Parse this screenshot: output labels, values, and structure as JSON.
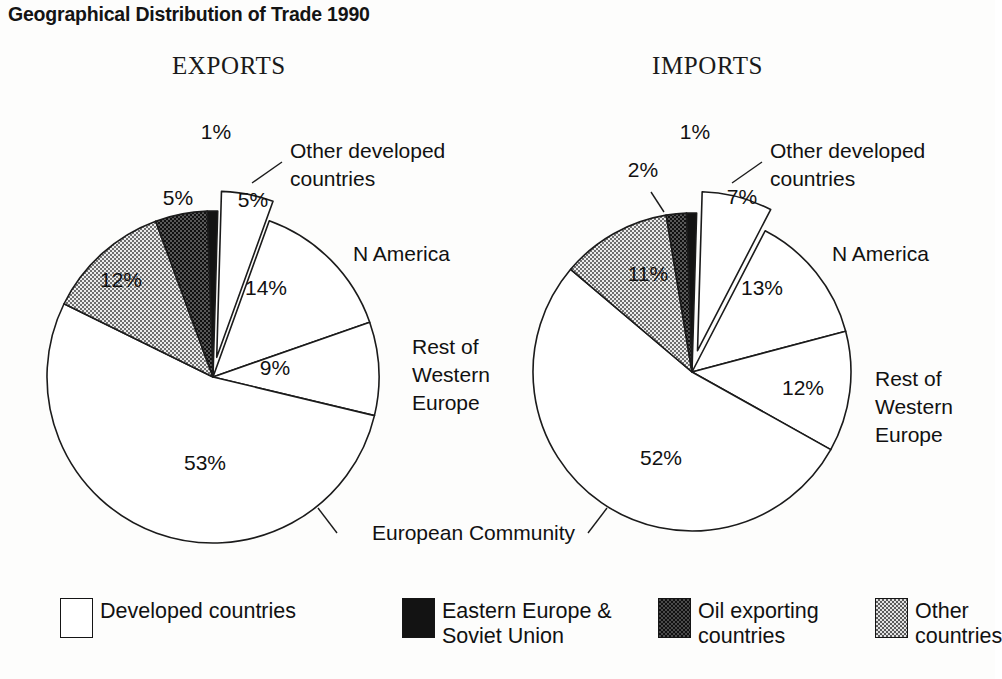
{
  "title": "Geographical Distribution of Trade 1990",
  "panels": {
    "exports_heading": "EXPORTS",
    "imports_heading": "IMPORTS"
  },
  "shared_labels": {
    "european_community": "European Community",
    "other_developed": "Other developed\ncountries",
    "other_developed_line1": "Other developed",
    "other_developed_line2": "countries",
    "n_america": "N America",
    "rest_w_europe_line1": "Rest of",
    "rest_w_europe_line2": "Western",
    "rest_w_europe_line3": "Europe"
  },
  "legend": {
    "items": [
      {
        "label": "Developed countries",
        "swatch": "sw-white",
        "color": "#ffffff",
        "name": "developed-countries"
      },
      {
        "label": "Eastern Europe &\nSoviet Union",
        "swatch": "sw-black",
        "color": "#131313",
        "name": "eastern-europe-soviet-union"
      },
      {
        "label": "Oil exporting\ncountries",
        "swatch": "sw-oil",
        "color": "#4a4a4a",
        "name": "oil-exporting-countries"
      },
      {
        "label": "Other countries",
        "swatch": "sw-other",
        "color": "#e2e2e2",
        "name": "other-countries"
      }
    ]
  },
  "pct_labels": {
    "exports": {
      "eastern_europe": "1%",
      "other_developed": "5%",
      "n_america": "14%",
      "rest_w_europe": "9%",
      "european_community": "53%",
      "other_countries": "12%",
      "oil_exporting": "5%"
    },
    "imports": {
      "eastern_europe": "1%",
      "oil_exporting": "2%",
      "other_developed": "7%",
      "n_america": "13%",
      "rest_w_europe": "12%",
      "european_community": "52%",
      "other_countries": "11%"
    }
  },
  "chart_data": {
    "type": "pie",
    "title": "Geographical Distribution of Trade 1990",
    "units": "percent",
    "legend_position": "bottom",
    "categories_legend": [
      "Developed countries",
      "Eastern Europe & Soviet Union",
      "Oil exporting countries",
      "Other countries"
    ],
    "charts": [
      {
        "name": "EXPORTS",
        "slices": [
          {
            "label": "Eastern Europe & Soviet Union",
            "display_label": "",
            "value": 1,
            "pct": "1%",
            "fill": "black",
            "exploded": false
          },
          {
            "label": "Other developed countries",
            "display_label": "Other developed countries",
            "value": 5,
            "pct": "5%",
            "fill": "white",
            "exploded": true
          },
          {
            "label": "N America",
            "display_label": "N America",
            "value": 14,
            "pct": "14%",
            "fill": "white",
            "exploded": false
          },
          {
            "label": "Rest of Western Europe",
            "display_label": "Rest of Western Europe",
            "value": 9,
            "pct": "9%",
            "fill": "white",
            "exploded": false
          },
          {
            "label": "European Community",
            "display_label": "European Community",
            "value": 53,
            "pct": "53%",
            "fill": "white",
            "exploded": false
          },
          {
            "label": "Other countries",
            "display_label": "",
            "value": 12,
            "pct": "12%",
            "fill": "light-checker",
            "exploded": false
          },
          {
            "label": "Oil exporting countries",
            "display_label": "",
            "value": 5,
            "pct": "5%",
            "fill": "dark-checker",
            "exploded": false
          }
        ]
      },
      {
        "name": "IMPORTS",
        "slices": [
          {
            "label": "Eastern Europe & Soviet Union",
            "display_label": "",
            "value": 1,
            "pct": "1%",
            "fill": "black",
            "exploded": false
          },
          {
            "label": "Other developed countries",
            "display_label": "Other developed countries",
            "value": 7,
            "pct": "7%",
            "fill": "white",
            "exploded": true
          },
          {
            "label": "N America",
            "display_label": "N America",
            "value": 13,
            "pct": "13%",
            "fill": "white",
            "exploded": false
          },
          {
            "label": "Rest of Western Europe",
            "display_label": "Rest of Western Europe",
            "value": 12,
            "pct": "12%",
            "fill": "white",
            "exploded": false
          },
          {
            "label": "European Community",
            "display_label": "European Community",
            "value": 52,
            "pct": "52%",
            "fill": "white",
            "exploded": false
          },
          {
            "label": "Other countries",
            "display_label": "",
            "value": 11,
            "pct": "11%",
            "fill": "light-checker",
            "exploded": false
          },
          {
            "label": "Oil exporting countries",
            "display_label": "",
            "value": 2,
            "pct": "2%",
            "fill": "dark-checker",
            "exploded": false
          }
        ]
      }
    ]
  }
}
